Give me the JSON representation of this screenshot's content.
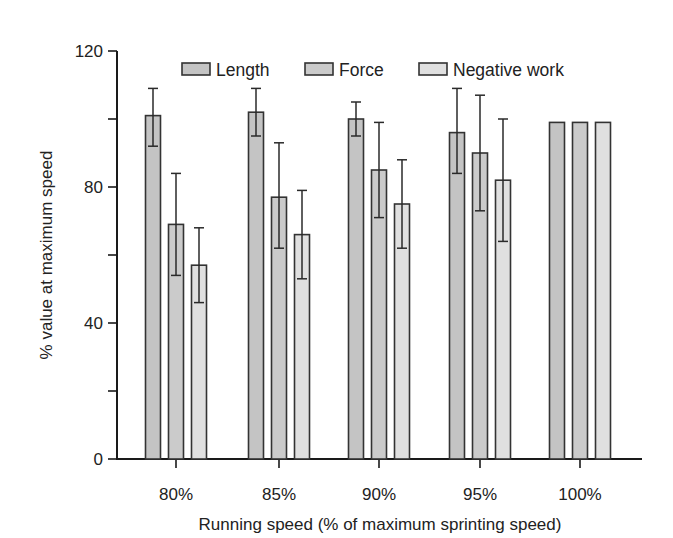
{
  "chart_data": {
    "type": "bar",
    "title": "",
    "xlabel": "Running speed (% of maximum sprinting speed)",
    "ylabel": "% value at maximum speed",
    "categories": [
      "80%",
      "85%",
      "90%",
      "95%",
      "100%"
    ],
    "ylim": [
      0,
      120
    ],
    "yticks": [
      0,
      20,
      40,
      60,
      80,
      100,
      120
    ],
    "ytick_labels": [
      "0",
      "",
      "40",
      "",
      "80",
      "",
      "120"
    ],
    "grid": false,
    "legend_position": "top inside",
    "series": [
      {
        "name": "Length",
        "color": "#c4c4c4",
        "values": [
          101,
          102,
          100,
          96,
          99
        ],
        "error_upper": [
          109,
          109,
          105,
          109,
          null
        ],
        "error_lower": [
          92,
          95,
          95,
          84,
          null
        ]
      },
      {
        "name": "Force",
        "color": "#cbcbcb",
        "values": [
          69,
          77,
          85,
          90,
          99
        ],
        "error_upper": [
          84,
          93,
          99,
          107,
          null
        ],
        "error_lower": [
          54,
          62,
          71,
          73,
          null
        ]
      },
      {
        "name": "Negative work",
        "color": "#e0e0e0",
        "values": [
          57,
          66,
          75,
          82,
          99
        ],
        "error_upper": [
          68,
          79,
          88,
          100,
          null
        ],
        "error_lower": [
          46,
          53,
          62,
          64,
          null
        ]
      }
    ]
  },
  "legend": {
    "items": [
      {
        "label": "Length",
        "color": "#c4c4c4"
      },
      {
        "label": "Force",
        "color": "#cbcbcb"
      },
      {
        "label": "Negative work",
        "color": "#e0e0e0"
      }
    ]
  },
  "axes": {
    "x_title": "Running speed (% of maximum sprinting speed)",
    "y_title": "% value at maximum speed"
  }
}
